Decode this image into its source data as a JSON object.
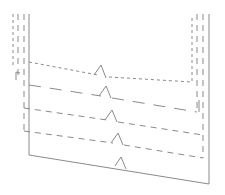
{
  "diagram": {
    "type": "line-sketch",
    "stroke_color": "#8a8a8a",
    "background": "#ffffff",
    "levels": [
      {
        "name": "level-1",
        "style": "short-dash",
        "left_y": 62,
        "right_y": 82,
        "marker_x": 101
      },
      {
        "name": "level-2",
        "style": "long-dash",
        "left_y": 85,
        "right_y": 112,
        "marker_x": 106
      },
      {
        "name": "level-3",
        "style": "medium-dash",
        "left_y": 108,
        "right_y": 135,
        "marker_x": 112
      },
      {
        "name": "level-4",
        "style": "medium-dash",
        "left_y": 131,
        "right_y": 158,
        "marker_x": 118
      },
      {
        "name": "bottom",
        "style": "solid",
        "left_y": 155,
        "right_y": 183,
        "marker_x": 122
      }
    ]
  }
}
